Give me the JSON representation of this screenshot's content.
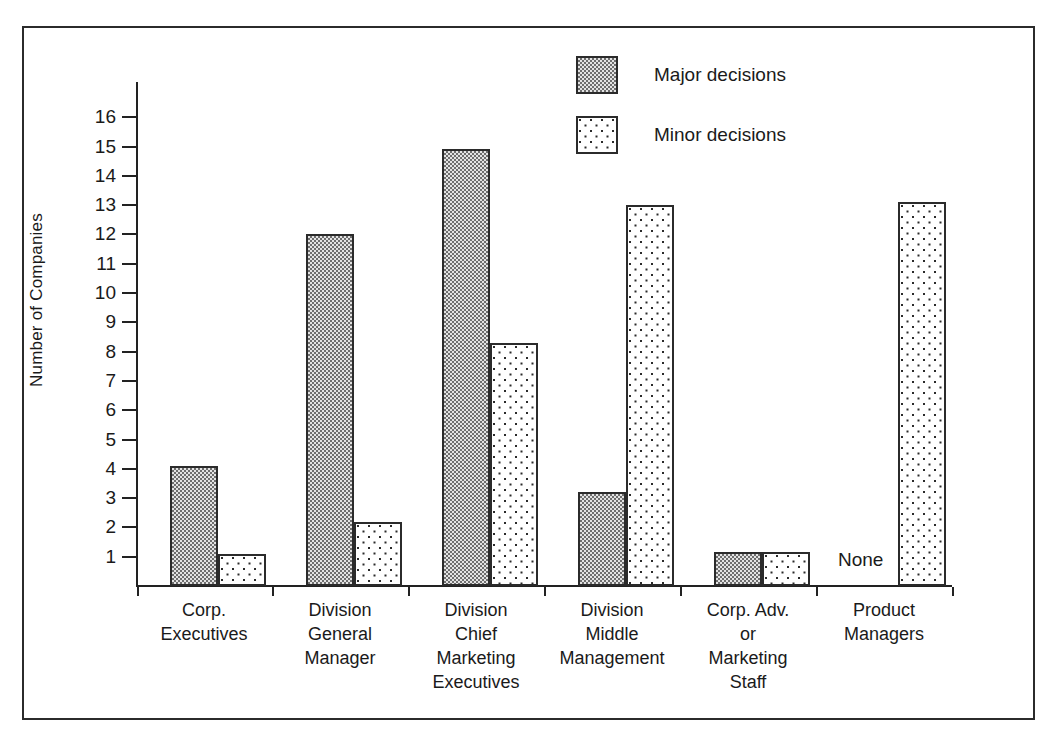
{
  "chart_data": {
    "type": "bar",
    "title": "",
    "xlabel": "",
    "ylabel": "Number of Companies",
    "ylim": [
      0,
      16.6
    ],
    "yticks": [
      16,
      15,
      14,
      13,
      12,
      11,
      10,
      9,
      8,
      7,
      6,
      5,
      4,
      3,
      2,
      1
    ],
    "grid": false,
    "legend_position": "top-center",
    "categories": [
      "Corp. Executives",
      "Division General Manager",
      "Division Chief Marketing Executives",
      "Division Middle Management",
      "Corp. Adv. or Marketing Staff",
      "Product Managers"
    ],
    "category_lines": [
      [
        "Corp.",
        "Executives"
      ],
      [
        "Division",
        "General",
        "Manager"
      ],
      [
        "Division",
        "Chief",
        "Marketing",
        "Executives"
      ],
      [
        "Division",
        "Middle",
        "Management"
      ],
      [
        "Corp. Adv.",
        "or",
        "Marketing",
        "Staff"
      ],
      [
        "Product",
        "Managers"
      ]
    ],
    "series": [
      {
        "name": "Major decisions",
        "pattern": "dense-checker-gray",
        "values": [
          4.1,
          12.0,
          14.9,
          3.2,
          1.15,
          0
        ]
      },
      {
        "name": "Minor decisions",
        "pattern": "sparse-dots",
        "values": [
          1.1,
          2.2,
          8.3,
          13.0,
          1.15,
          13.1
        ]
      }
    ],
    "annotations": [
      {
        "text": "None",
        "category": "Product Managers",
        "series": "Major decisions",
        "value": 0
      }
    ]
  },
  "legend": {
    "items": [
      {
        "label": "Major decisions",
        "pattern": "dense-checker-gray"
      },
      {
        "label": "Minor decisions",
        "pattern": "sparse-dots"
      }
    ]
  },
  "colors": {
    "ink": "#2b2b2b",
    "major_fill": "#e3e3e3",
    "minor_fill": "#ffffff",
    "page": "#ffffff"
  }
}
